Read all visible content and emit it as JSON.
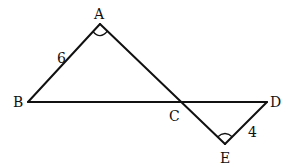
{
  "diagram": {
    "type": "geometry",
    "points": {
      "A": {
        "label": "A",
        "x": 100,
        "y": 24
      },
      "B": {
        "label": "B",
        "x": 28,
        "y": 102
      },
      "C": {
        "label": "C",
        "x": 180,
        "y": 102
      },
      "D": {
        "label": "D",
        "x": 267,
        "y": 102
      },
      "E": {
        "label": "E",
        "x": 225,
        "y": 144
      }
    },
    "segments": [
      "AB",
      "BD",
      "AE",
      "DE"
    ],
    "lengths": {
      "AB": "6",
      "DE": "4"
    },
    "angle_marks": [
      "A",
      "E"
    ]
  }
}
